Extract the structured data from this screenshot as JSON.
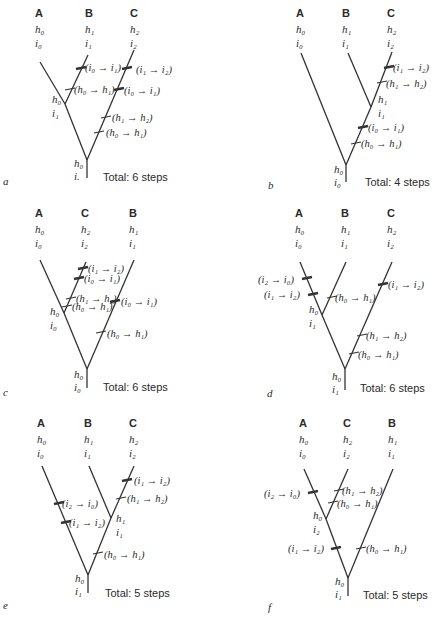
{
  "figure": {
    "caption_partial": "FIGURE",
    "panels": [
      {
        "id": "a",
        "total": "Total: 6 steps",
        "taxa": [
          {
            "name": "A",
            "h": "h0",
            "i": "i0"
          },
          {
            "name": "B",
            "h": "h1",
            "i": "i1"
          },
          {
            "name": "C",
            "h": "h2",
            "i": "i2"
          }
        ],
        "internal_node": {
          "h": "h0",
          "i": "i1"
        },
        "root": {
          "h": "h0",
          "i": "i."
        },
        "changes": [
          "(i0 → i1)",
          "(h0 → h1)",
          "(i1 → i2)",
          "(i0 → i1)",
          "(h1 → h2)",
          "(h0 → h1)"
        ]
      },
      {
        "id": "b",
        "total": "Total: 4 steps",
        "taxa": [
          {
            "name": "A",
            "h": "h0",
            "i": "i0"
          },
          {
            "name": "B",
            "h": "h1",
            "i": "i1"
          },
          {
            "name": "C",
            "h": "h2",
            "i": "i2"
          }
        ],
        "internal_node": {
          "h": "h1",
          "i": "i1"
        },
        "root": {
          "h": "h0",
          "i": "i0"
        },
        "changes": [
          "(i1 → i2)",
          "(h1 → h2)",
          "(i0 → i1)",
          "(h0 → h1)"
        ]
      },
      {
        "id": "c",
        "total": "Total: 6 steps",
        "taxa": [
          {
            "name": "A",
            "h": "h0",
            "i": "i0"
          },
          {
            "name": "C",
            "h": "h2",
            "i": "i2"
          },
          {
            "name": "B",
            "h": "h1",
            "i": "i1"
          }
        ],
        "internal_node": {
          "h": "h0",
          "i": "i0"
        },
        "root": {
          "h": "h0",
          "i": "i0"
        },
        "changes": [
          "(i1 → i2)",
          "(i0 → i1)",
          "(h1 → h2)",
          "(h0 → h1)",
          "(i0 → i1)",
          "(h0 → h1)"
        ]
      },
      {
        "id": "d",
        "total": "Total: 6 steps",
        "taxa": [
          {
            "name": "A",
            "h": "h0",
            "i": "i0"
          },
          {
            "name": "B",
            "h": "h1",
            "i": "i1"
          },
          {
            "name": "C",
            "h": "h2",
            "i": "i2"
          }
        ],
        "internal_node": {
          "h": "h0",
          "i": "i1"
        },
        "root": {
          "h": "h0",
          "i": "i1"
        },
        "changes": [
          "(i2 → i0)",
          "(i1 → i2)",
          "(h0 → h1)",
          "(i1 → i2)",
          "(h1 → h2)",
          "(h0 → h1)"
        ]
      },
      {
        "id": "e",
        "total": "Total: 5 steps",
        "taxa": [
          {
            "name": "A",
            "h": "h0",
            "i": "i0"
          },
          {
            "name": "B",
            "h": "h1",
            "i": "i1"
          },
          {
            "name": "C",
            "h": "h2",
            "i": "i2"
          }
        ],
        "internal_node": {
          "h": "h1",
          "i": "i1"
        },
        "root": {
          "h": "h0",
          "i": "i1"
        },
        "changes": [
          "(i2 → i0)",
          "(i1 → i2)",
          "(i1 → i2)",
          "(h1 → h2)",
          "(h0 → h1)"
        ]
      },
      {
        "id": "f",
        "total": "Total: 5 steps",
        "taxa": [
          {
            "name": "A",
            "h": "h0",
            "i": "i0"
          },
          {
            "name": "C",
            "h": "h2",
            "i": "i2"
          },
          {
            "name": "B",
            "h": "h1",
            "i": "i1"
          }
        ],
        "internal_node": {
          "h": "h0",
          "i": "i2"
        },
        "root": {
          "h": "h0",
          "i": "i1"
        },
        "changes": [
          "(i2 → i0)",
          "(h1 → h2)",
          "(h0 → h1)",
          "(i1 → i2)",
          "(h0 → h1)"
        ]
      }
    ]
  }
}
